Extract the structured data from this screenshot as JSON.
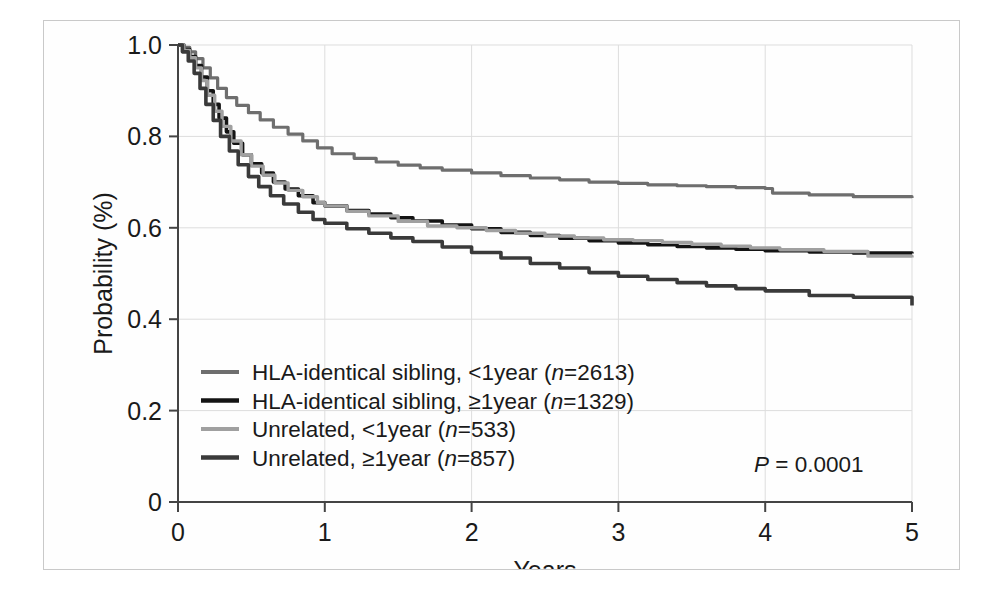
{
  "chart_data": {
    "type": "line",
    "title": "",
    "xlabel": "Years",
    "ylabel": "Probability (%)",
    "xlim": [
      0,
      5
    ],
    "ylim": [
      0,
      1.0
    ],
    "xticks": [
      "0",
      "1",
      "2",
      "3",
      "4",
      "5"
    ],
    "xtick_values": [
      0,
      1,
      2,
      3,
      4,
      5
    ],
    "yticks": [
      "0",
      "0.2",
      "0.4",
      "0.6",
      "0.8",
      "1.0"
    ],
    "ytick_values": [
      0,
      0.2,
      0.4,
      0.6,
      0.8,
      1.0
    ],
    "grid": true,
    "legend_position": "lower-left",
    "annotation": "P = 0.0001",
    "annotation_prefix": "P",
    "annotation_rest": " = 0.0001",
    "series": [
      {
        "name": "HLA-identical sibling, <1year (n=2613)",
        "label_prefix": "HLA-identical sibling, <1year (",
        "label_italic": "n",
        "label_suffix": "=2613)",
        "n": 2613,
        "color": "#6e6e6e",
        "width": 3.2,
        "x": [
          0,
          0.04,
          0.08,
          0.12,
          0.17,
          0.22,
          0.27,
          0.33,
          0.4,
          0.48,
          0.56,
          0.65,
          0.75,
          0.85,
          0.95,
          1.05,
          1.2,
          1.35,
          1.5,
          1.65,
          1.8,
          2.0,
          2.2,
          2.4,
          2.6,
          2.8,
          3.0,
          3.2,
          3.4,
          3.6,
          3.8,
          4.0,
          4.05,
          4.3,
          4.6,
          5.0
        ],
        "y": [
          1.0,
          0.995,
          0.985,
          0.97,
          0.95,
          0.928,
          0.905,
          0.885,
          0.868,
          0.852,
          0.836,
          0.82,
          0.805,
          0.79,
          0.775,
          0.762,
          0.752,
          0.744,
          0.737,
          0.731,
          0.726,
          0.72,
          0.714,
          0.709,
          0.705,
          0.7,
          0.697,
          0.694,
          0.692,
          0.69,
          0.688,
          0.686,
          0.676,
          0.672,
          0.668,
          0.665
        ]
      },
      {
        "name": "HLA-identical sibling, ≥1year (n=1329)",
        "label_prefix": "HLA-identical sibling, ≥1year (",
        "label_italic": "n",
        "label_suffix": "=1329)",
        "n": 1329,
        "color": "#141414",
        "width": 3.6,
        "x": [
          0,
          0.04,
          0.08,
          0.12,
          0.16,
          0.2,
          0.24,
          0.28,
          0.33,
          0.38,
          0.44,
          0.5,
          0.57,
          0.65,
          0.73,
          0.82,
          0.92,
          1.0,
          1.15,
          1.3,
          1.45,
          1.6,
          1.8,
          2.0,
          2.2,
          2.4,
          2.6,
          2.8,
          3.0,
          3.2,
          3.4,
          3.6,
          3.8,
          4.0,
          4.3,
          4.6,
          5.0
        ],
        "y": [
          1.0,
          0.99,
          0.975,
          0.955,
          0.93,
          0.9,
          0.87,
          0.84,
          0.81,
          0.785,
          0.76,
          0.74,
          0.72,
          0.7,
          0.685,
          0.67,
          0.655,
          0.648,
          0.638,
          0.63,
          0.622,
          0.615,
          0.606,
          0.598,
          0.59,
          0.583,
          0.577,
          0.572,
          0.567,
          0.563,
          0.559,
          0.556,
          0.553,
          0.55,
          0.547,
          0.545,
          0.544
        ]
      },
      {
        "name": "Unrelated, <1year (n=533)",
        "label_prefix": "Unrelated, <1year (",
        "label_italic": "n",
        "label_suffix": "=533)",
        "n": 533,
        "color": "#a0a0a0",
        "width": 3.4,
        "x": [
          0,
          0.04,
          0.08,
          0.12,
          0.16,
          0.2,
          0.25,
          0.3,
          0.36,
          0.43,
          0.5,
          0.58,
          0.66,
          0.75,
          0.85,
          0.95,
          1.0,
          1.15,
          1.3,
          1.5,
          1.7,
          1.9,
          2.1,
          2.3,
          2.5,
          2.7,
          2.9,
          3.1,
          3.3,
          3.5,
          3.7,
          3.9,
          4.1,
          4.4,
          4.7,
          5.0
        ],
        "y": [
          1.0,
          0.988,
          0.972,
          0.95,
          0.922,
          0.89,
          0.855,
          0.822,
          0.79,
          0.76,
          0.735,
          0.715,
          0.698,
          0.682,
          0.668,
          0.655,
          0.648,
          0.636,
          0.626,
          0.614,
          0.604,
          0.6,
          0.594,
          0.588,
          0.582,
          0.578,
          0.574,
          0.572,
          0.568,
          0.564,
          0.56,
          0.556,
          0.552,
          0.548,
          0.538,
          0.535
        ]
      },
      {
        "name": "Unrelated, ≥1year (n=857)",
        "label_prefix": "Unrelated, ≥1year (",
        "label_italic": "n",
        "label_suffix": "=857)",
        "n": 857,
        "color": "#3a3a3a",
        "width": 3.6,
        "x": [
          0,
          0.03,
          0.07,
          0.11,
          0.15,
          0.19,
          0.24,
          0.29,
          0.35,
          0.41,
          0.48,
          0.55,
          0.63,
          0.72,
          0.82,
          0.92,
          1.0,
          1.15,
          1.3,
          1.45,
          1.6,
          1.8,
          2.0,
          2.2,
          2.4,
          2.6,
          2.8,
          3.0,
          3.2,
          3.4,
          3.6,
          3.8,
          4.0,
          4.3,
          4.6,
          5.0
        ],
        "y": [
          1.0,
          0.985,
          0.965,
          0.938,
          0.905,
          0.87,
          0.835,
          0.8,
          0.768,
          0.738,
          0.712,
          0.69,
          0.67,
          0.652,
          0.634,
          0.618,
          0.61,
          0.598,
          0.588,
          0.578,
          0.57,
          0.558,
          0.546,
          0.534,
          0.522,
          0.512,
          0.502,
          0.494,
          0.487,
          0.48,
          0.473,
          0.467,
          0.462,
          0.452,
          0.448,
          0.43
        ]
      }
    ]
  }
}
